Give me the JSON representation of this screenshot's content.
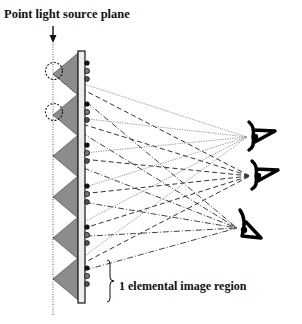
{
  "labels": {
    "title": "Point light source plane",
    "region": "1 elemental image region"
  },
  "colors": {
    "triangle_fill": "#8c8c8c",
    "plate_fill": "#eeeeee",
    "stroke": "#111111",
    "ray_solid": "#888888",
    "ray_dashed": "#333333",
    "ray_dashdot": "#444444"
  },
  "geometry": {
    "plane_x": 53,
    "plate": {
      "x": 78,
      "y": 51,
      "w": 7,
      "h": 252
    },
    "apex_ys": [
      74,
      115,
      156,
      197,
      238,
      279
    ],
    "half_height": 21,
    "eyes": [
      {
        "name": "top",
        "x": 255,
        "y": 137
      },
      {
        "name": "middle",
        "x": 258,
        "y": 176
      },
      {
        "name": "bottom",
        "x": 245,
        "y": 228
      }
    ]
  }
}
